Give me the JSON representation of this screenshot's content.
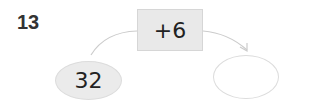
{
  "problem": {
    "number": "13",
    "operation": "+6",
    "start_value": "32",
    "answer_value": ""
  },
  "colors": {
    "box_fill": "#e9e9e9",
    "ellipse_fill": "#ebebeb",
    "line": "#cccccc",
    "text": "#222222"
  }
}
